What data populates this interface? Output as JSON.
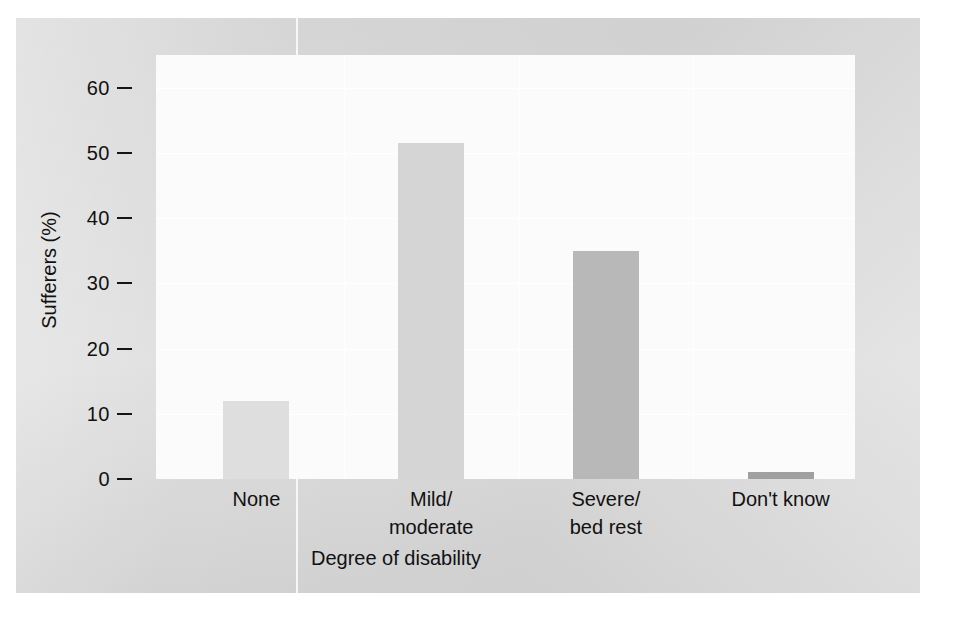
{
  "chart_data": {
    "type": "bar",
    "title": "",
    "subtitle": "",
    "xlabel": "Degree of disability",
    "ylabel": "Sufferers (%)",
    "categories": [
      "None",
      "Mild/\nmoderate",
      "Severe/\nbed rest",
      "Don't know"
    ],
    "values": [
      12,
      51.5,
      35,
      1
    ],
    "ylim": [
      0,
      65
    ],
    "yticks": [
      0,
      10,
      20,
      30,
      40,
      50,
      60
    ],
    "ytick_labels": [
      "0",
      "10",
      "20",
      "30",
      "40",
      "50",
      "60"
    ],
    "grid": true,
    "grid_axis": "y",
    "legend": false,
    "legend_position": "none",
    "bar_colors": [
      "#dedede",
      "#d5d5d5",
      "#b8b8b8",
      "#a0a0a0"
    ]
  },
  "figure": {
    "background_color": "#d8d8d8",
    "plot_background_color": "#fbfbfb",
    "text_color": "#111111",
    "gridline_color": "#ffffff"
  }
}
